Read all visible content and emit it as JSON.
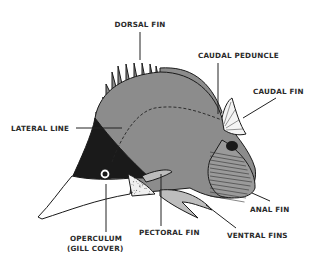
{
  "colors": {
    "background": "#ffffff",
    "body": "#8c8c8c",
    "head_mask": "#1a1a1a",
    "snout": "#ffffff",
    "ink": "#222222"
  },
  "labels": {
    "dorsal_fin": "DORSAL FIN",
    "caudal_peduncle": "CAUDAL PEDUNCLE",
    "caudal_fin": "CAUDAL FIN",
    "lateral_line": "LATERAL LINE",
    "anal_fin": "ANAL FIN",
    "operculum_line1": "OPERCULUM",
    "operculum_line2": "(GILL COVER)",
    "pectoral_fin": "PECTORAL FIN",
    "ventral_fins": "VENTRAL FINS"
  }
}
